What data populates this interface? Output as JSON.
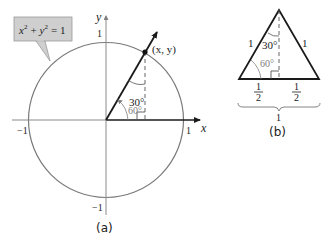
{
  "figure_a": {
    "caption": "(a)",
    "equation_label": {
      "base_x": "x",
      "exp_x": "2",
      "plus": "+",
      "base_y": "y",
      "exp_y": "2",
      "rhs": "= 1"
    },
    "axis_labels": {
      "x": "x",
      "y": "y"
    },
    "ticks": {
      "x_pos": "1",
      "x_neg": "−1",
      "y_pos": "1",
      "y_neg": "−1"
    },
    "point_label": "(x, y)",
    "angle_30": "30°",
    "angle_60": "60°",
    "colors": {
      "circle": "#7a7a7a",
      "axis_neg": "#8a8a8a",
      "axis_pos": "#1a1a1a",
      "label_box_fill": "#cfcfcf",
      "label_box_stroke": "#9a9a9a",
      "angle_60_text": "#808080"
    }
  },
  "figure_b": {
    "caption": "(b)",
    "side_left": "1",
    "side_right": "1",
    "angle_30": "30°",
    "angle_60": "60°",
    "half_left_num": "1",
    "half_left_den": "2",
    "half_right_num": "1",
    "half_right_den": "2",
    "base_total": "1"
  }
}
